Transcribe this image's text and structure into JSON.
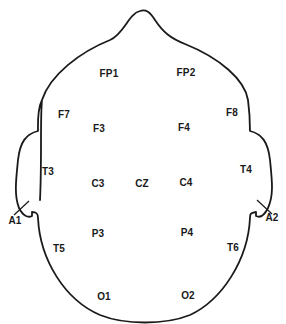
{
  "figure": {
    "type": "EEG 10-20 electrode placement head diagram",
    "line_color": "#1a1a1a",
    "background": "#ffffff"
  },
  "electrodes": [
    {
      "id": "FP1",
      "label": "FP1",
      "x": 109,
      "y": 74
    },
    {
      "id": "FP2",
      "label": "FP2",
      "x": 186,
      "y": 73
    },
    {
      "id": "F7",
      "label": "F7",
      "x": 64,
      "y": 115
    },
    {
      "id": "F8",
      "label": "F8",
      "x": 232,
      "y": 113
    },
    {
      "id": "F3",
      "label": "F3",
      "x": 99,
      "y": 129
    },
    {
      "id": "F4",
      "label": "F4",
      "x": 184,
      "y": 128
    },
    {
      "id": "T3",
      "label": "T3",
      "x": 48,
      "y": 172
    },
    {
      "id": "C3",
      "label": "C3",
      "x": 98,
      "y": 184
    },
    {
      "id": "CZ",
      "label": "CZ",
      "x": 142,
      "y": 184
    },
    {
      "id": "C4",
      "label": "C4",
      "x": 186,
      "y": 183
    },
    {
      "id": "T4",
      "label": "T4",
      "x": 246,
      "y": 170
    },
    {
      "id": "A1",
      "label": "A1",
      "x": 15,
      "y": 221
    },
    {
      "id": "A2",
      "label": "A2",
      "x": 272,
      "y": 218
    },
    {
      "id": "P3",
      "label": "P3",
      "x": 98,
      "y": 234
    },
    {
      "id": "P4",
      "label": "P4",
      "x": 187,
      "y": 233
    },
    {
      "id": "T5",
      "label": "T5",
      "x": 59,
      "y": 249
    },
    {
      "id": "T6",
      "label": "T6",
      "x": 233,
      "y": 248
    },
    {
      "id": "O1",
      "label": "O1",
      "x": 104,
      "y": 297
    },
    {
      "id": "O2",
      "label": "O2",
      "x": 188,
      "y": 296
    }
  ]
}
